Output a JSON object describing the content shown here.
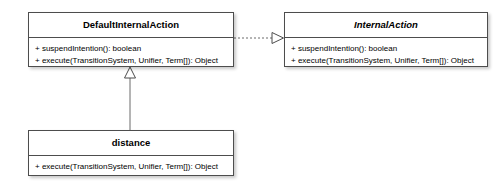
{
  "diagram": {
    "type": "uml-class-diagram",
    "background_color": "#ffffff",
    "border_color": "#4d4d4d",
    "text_color": "#000000",
    "classes": [
      {
        "id": "default-internal-action",
        "name": "DefaultInternalAction",
        "abstract": false,
        "members": [
          "+ suspendIntention(): boolean",
          "+ execute(TransitionSystem, Unifier, Term[]): Object"
        ]
      },
      {
        "id": "internal-action",
        "name": "InternalAction",
        "abstract": true,
        "members": [
          "+ suspendIntention(): boolean",
          "+ execute(TransitionSystem, Unifier, Term[]): Object"
        ]
      },
      {
        "id": "distance",
        "name": "distance",
        "abstract": false,
        "members": [
          "+ execute(TransitionSystem, Unifier, Term[]): Object"
        ]
      }
    ],
    "relationships": [
      {
        "id": "realization-default-to-internal",
        "kind": "realization",
        "line_style": "dashed",
        "arrow_head": "hollow-triangle",
        "source": "DefaultInternalAction",
        "target": "InternalAction"
      },
      {
        "id": "generalization-distance-to-default",
        "kind": "generalization",
        "line_style": "solid",
        "arrow_head": "hollow-triangle",
        "source": "distance",
        "target": "DefaultInternalAction"
      }
    ]
  }
}
